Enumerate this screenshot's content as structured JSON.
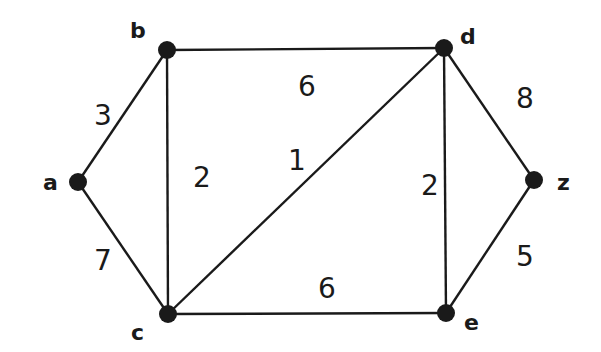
{
  "graph": {
    "title": "Weighted undirected graph",
    "nodes": [
      {
        "id": "a",
        "label": "a"
      },
      {
        "id": "b",
        "label": "b"
      },
      {
        "id": "c",
        "label": "c"
      },
      {
        "id": "d",
        "label": "d"
      },
      {
        "id": "e",
        "label": "e"
      },
      {
        "id": "z",
        "label": "z"
      }
    ],
    "edges": [
      {
        "from": "a",
        "to": "b",
        "weight": "3"
      },
      {
        "from": "a",
        "to": "c",
        "weight": "7"
      },
      {
        "from": "b",
        "to": "c",
        "weight": "2"
      },
      {
        "from": "b",
        "to": "d",
        "weight": "6"
      },
      {
        "from": "c",
        "to": "d",
        "weight": "1"
      },
      {
        "from": "c",
        "to": "e",
        "weight": "6"
      },
      {
        "from": "d",
        "to": "e",
        "weight": "2"
      },
      {
        "from": "d",
        "to": "z",
        "weight": "8"
      },
      {
        "from": "e",
        "to": "z",
        "weight": "5"
      }
    ],
    "colors": {
      "ink": "#1a1a1a",
      "background": "#ffffff"
    }
  }
}
